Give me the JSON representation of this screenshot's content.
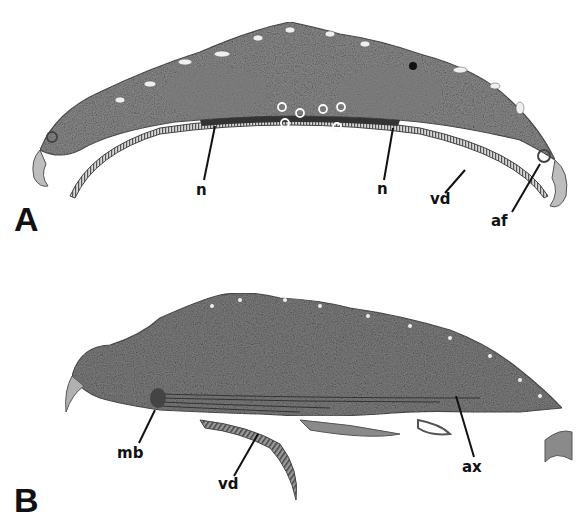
{
  "figure": {
    "caption_fragment": "",
    "panels": [
      {
        "letter": "A",
        "labels": [
          "n",
          "n",
          "vd",
          "af"
        ]
      },
      {
        "letter": "B",
        "labels": [
          "mb",
          "vd",
          "ax"
        ]
      }
    ]
  }
}
